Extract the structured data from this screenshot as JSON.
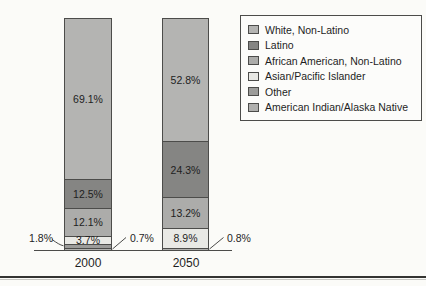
{
  "chart_data": {
    "type": "bar",
    "stacking": "percent",
    "title": "",
    "xlabel": "",
    "ylabel": "",
    "ylim": [
      0,
      100
    ],
    "grid": false,
    "legend_position": "top-right",
    "categories": [
      "2000",
      "2050"
    ],
    "series": [
      {
        "name": "White, Non-Latino",
        "values": [
          69.1,
          52.8
        ]
      },
      {
        "name": "Latino",
        "values": [
          12.5,
          24.3
        ]
      },
      {
        "name": "African American, Non-Latino",
        "values": [
          12.1,
          13.2
        ]
      },
      {
        "name": "Asian/Pacific Islander",
        "values": [
          3.7,
          8.9
        ]
      },
      {
        "name": "Other",
        "values": [
          1.8,
          null
        ]
      },
      {
        "name": "American Indian/Alaska Native",
        "values": [
          0.7,
          0.8
        ]
      }
    ],
    "colors": {
      "White, Non-Latino": "#b4b4b2",
      "Latino": "#858583",
      "African American, Non-Latino": "#acacaa",
      "Asian/Pacific Islander": "#e9e9e5",
      "Other": "#9c9c9a",
      "American Indian/Alaska Native": "#b0b0ae"
    },
    "bars": [
      {
        "year": "2000",
        "segments": [
          {
            "category": "White, Non-Latino",
            "value": 69.1,
            "label": "69.1%",
            "label_pos": "inside"
          },
          {
            "category": "Latino",
            "value": 12.5,
            "label": "12.5%",
            "label_pos": "inside"
          },
          {
            "category": "African American, Non-Latino",
            "value": 12.1,
            "label": "12.1%",
            "label_pos": "inside"
          },
          {
            "category": "Asian/Pacific Islander",
            "value": 3.7,
            "label": "3.7%",
            "label_pos": "inside"
          },
          {
            "category": "Other",
            "value": 1.8,
            "label": "1.8%",
            "label_pos": "callout-left"
          },
          {
            "category": "American Indian/Alaska Native",
            "value": 0.7,
            "label": "0.7%",
            "label_pos": "callout-right"
          }
        ]
      },
      {
        "year": "2050",
        "segments": [
          {
            "category": "White, Non-Latino",
            "value": 52.8,
            "label": "52.8%",
            "label_pos": "inside"
          },
          {
            "category": "Latino",
            "value": 24.3,
            "label": "24.3%",
            "label_pos": "inside"
          },
          {
            "category": "African American, Non-Latino",
            "value": 13.2,
            "label": "13.2%",
            "label_pos": "inside"
          },
          {
            "category": "Asian/Pacific Islander",
            "value": 8.9,
            "label": "8.9%",
            "label_pos": "inside"
          },
          {
            "category": "American Indian/Alaska Native",
            "value": 0.8,
            "label": "0.8%",
            "label_pos": "callout-right"
          }
        ]
      }
    ]
  }
}
